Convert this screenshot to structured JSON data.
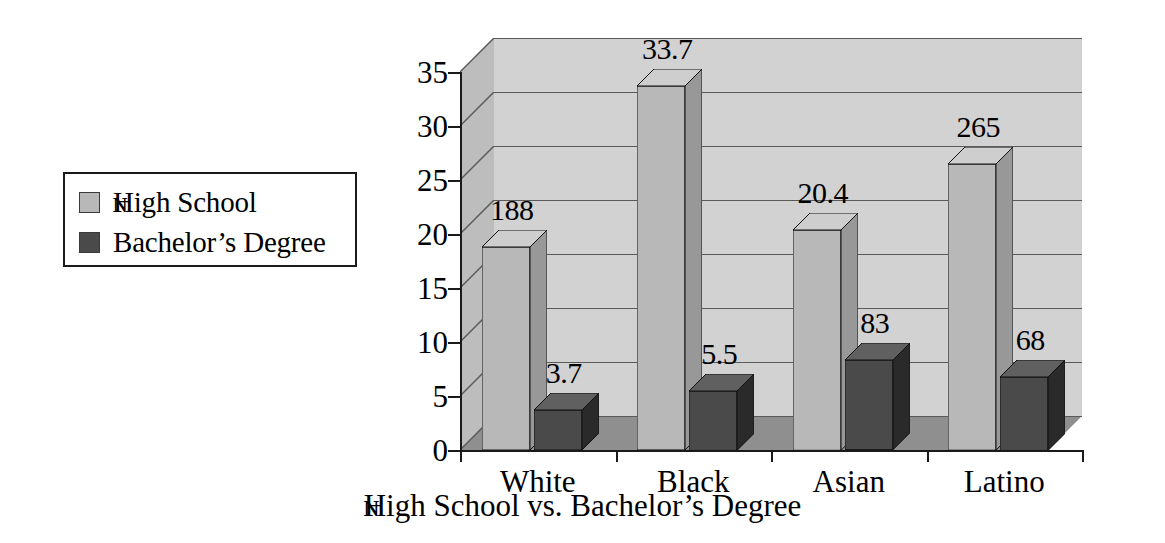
{
  "chart_data": {
    "type": "bar",
    "title": "",
    "xlabel": "ɴHigh School vs. Bachelor’s Degree",
    "ylabel": "",
    "categories": [
      "White",
      "Black",
      "Asian",
      "Latino"
    ],
    "series": [
      {
        "name": "ɴHigh School",
        "color": "#b8b8b8",
        "values": [
          18.8,
          33.7,
          20.4,
          26.5
        ],
        "value_labels": [
          "188",
          "33.7",
          "20.4",
          "265"
        ]
      },
      {
        "name": "Bachelor’s Degree",
        "color": "#4a4a4a",
        "values": [
          3.7,
          5.5,
          8.3,
          6.8
        ],
        "value_labels": [
          "3.7",
          "5.5",
          "83",
          "68"
        ]
      }
    ],
    "ylim": [
      0,
      35
    ],
    "yticks": [
      0,
      5,
      10,
      15,
      20,
      25,
      30,
      35
    ],
    "ytick_labels": [
      "0",
      "5",
      "10",
      "15",
      "20",
      "25",
      "30",
      "35"
    ],
    "grid": true,
    "legend_position": "left-outside",
    "style": "3d-bar"
  },
  "legend": {
    "items": [
      {
        "label_prefix": "ɴ",
        "label": "High School",
        "swatch": "#b8b8b8"
      },
      {
        "label_prefix": "",
        "label": "Bachelor’s Degree",
        "swatch": "#4a4a4a"
      }
    ]
  },
  "axis": {
    "x_title_prefix": "ɴ",
    "x_title": "High School vs. Bachelor’s Degree"
  },
  "colors": {
    "series_light": "#b8b8b8",
    "series_dark": "#4a4a4a",
    "wall_back": "#d2d2d2",
    "wall_side": "#bdbdbd",
    "floor": "#8a8a8a",
    "axis": "#1a1a1a"
  }
}
